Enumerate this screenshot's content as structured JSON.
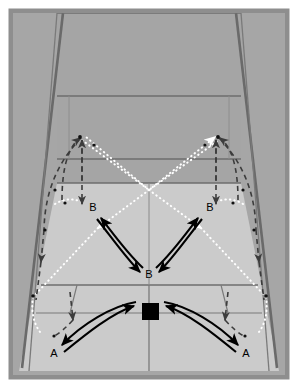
{
  "diagram": {
    "type": "tennis-court-perspective",
    "canvas": {
      "width": 298,
      "height": 388
    },
    "colors": {
      "page_background": "#ffffff",
      "outer_frame": "#8e8e8e",
      "surround_gray": "#a9a9a9",
      "far_court": "#a3a3a3",
      "near_court": "#cccccc",
      "court_line": "#6e6e6e",
      "fence_line": "#6a6a6a",
      "dark_arrow": "#000000",
      "dashed_arc": "#4a4a4a",
      "dotted_ball": "#ffffff",
      "player_marker": "#000000",
      "label_text": "#000000"
    },
    "labels": [
      {
        "id": "b-left",
        "text": "B",
        "x": 93,
        "y": 211
      },
      {
        "id": "b-right",
        "text": "B",
        "x": 210,
        "y": 211
      },
      {
        "id": "b-center",
        "text": "B",
        "x": 149,
        "y": 275
      },
      {
        "id": "a-left",
        "text": "A",
        "x": 54,
        "y": 353
      },
      {
        "id": "a-right",
        "text": "A",
        "x": 246,
        "y": 353
      }
    ],
    "legend_semantics": {
      "solid_black_arrow": "player movement path",
      "dark_dashed_arc": "lob / high ball trajectory",
      "white_dotted_line": "ball flight path",
      "black_square": "player start position"
    },
    "player_marker": {
      "x": 142,
      "y": 303,
      "width": 17,
      "height": 17
    }
  }
}
